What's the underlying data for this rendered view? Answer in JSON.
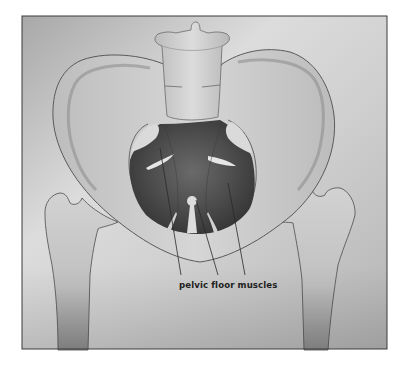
{
  "figure": {
    "label": "pelvic floor muscles",
    "colors": {
      "frame_border": "#3a3a3a",
      "background_light": "#e6e6e6",
      "background_dark": "#a9a9a9",
      "bone_fill": "#c9c9c9",
      "bone_outline": "#5a5a5a",
      "muscle_dark": "#3e3e3e",
      "muscle_mid": "#666666",
      "leader_line": "#2a2a2a"
    }
  }
}
